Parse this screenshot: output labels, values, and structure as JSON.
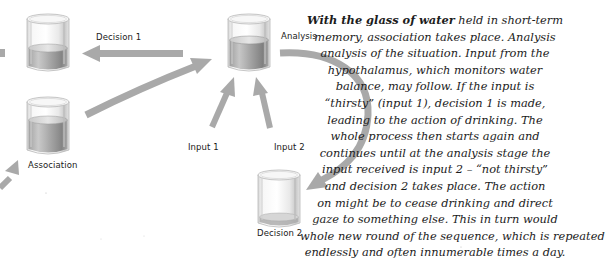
{
  "diagram": {
    "nodes": {
      "decision1_glass": {
        "label": "",
        "water_level": "low"
      },
      "association": {
        "label": "Association",
        "water_level": "mid"
      },
      "analysis": {
        "label": "Analysis",
        "water_level": "mid"
      },
      "decision2": {
        "label": "Decision 2",
        "water_level": "empty"
      }
    },
    "arrow_labels": {
      "decision1": "Decision 1",
      "input1": "Input 1",
      "input2": "Input 2"
    },
    "colors": {
      "arrow": "#a9a9a9",
      "glass_outline": "#bdbdbd",
      "water": "#8c8c8c",
      "text": "#1c1c1c"
    }
  },
  "caption": {
    "bold_lead": "With the glass of water",
    "lines": [
      " held in short-term",
      "memory, association takes place. Analysis",
      "analysis of the situation. Input from the",
      "hypothalamus, which monitors water",
      "balance, may follow. If the input is",
      "“thirsty” (input 1), decision 1 is made,",
      "leading to the action of drinking. The",
      "whole process then starts again and",
      "continues until at the analysis stage the",
      "input received is input 2 – “not thirsty”",
      "and decision 2 takes place. The action",
      "on might be to cease drinking and direct",
      "gaze to something else. This in turn would",
      "whole new round of the sequence, which is repeated",
      "endlessly and often innumerable times a day."
    ]
  }
}
